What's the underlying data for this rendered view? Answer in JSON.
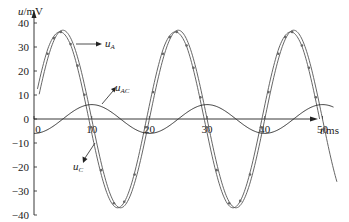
{
  "chart_data": {
    "type": "line",
    "title": "",
    "xlabel": "t/ms",
    "ylabel": "u/mV",
    "xlim": [
      0,
      55
    ],
    "ylim": [
      -40,
      42
    ],
    "grid": false,
    "x_ticks": [
      0,
      10,
      20,
      30,
      40,
      50
    ],
    "y_ticks": [
      40,
      30,
      20,
      10,
      0,
      -10,
      -20,
      -30,
      -40
    ],
    "series": [
      {
        "name": "u_A",
        "description": "sinusoid, amplitude ~37 mV, period ~20 ms, peaks near t=5, 25, 45 ms",
        "amplitude": 37,
        "period_ms": 20,
        "peak_times_ms": [
          4.5,
          25,
          45
        ],
        "trough_times_ms": [
          15,
          35
        ]
      },
      {
        "name": "u_C",
        "description": "sinusoid nearly coincident with u_A, slightly phase-lagged, amplitude ~37 mV",
        "amplitude": 37,
        "period_ms": 20,
        "peak_times_ms": [
          5,
          25.5,
          45.5
        ],
        "trough_times_ms": [
          15.5,
          35.5
        ]
      },
      {
        "name": "u_AC",
        "description": "small sinusoid, amplitude ~6 mV, period ~20 ms, starts ~-6 at t=0, peaks near t=10, 30, 50",
        "amplitude": 6,
        "period_ms": 20,
        "peak_times_ms": [
          10,
          30,
          50
        ],
        "trough_times_ms": [
          0,
          20,
          40
        ]
      }
    ],
    "annotations": [
      {
        "text": "u_A",
        "points_to": "u_A curve near t=10ms, 32mV"
      },
      {
        "text": "u_AC",
        "points_to": "u_AC curve near t=13ms"
      },
      {
        "text": "u_C",
        "points_to": "u_C curve near t=9ms, -10mV"
      }
    ]
  },
  "labels": {
    "ylabel_main": "u",
    "ylabel_unit": "/mV",
    "xlabel_main": "t",
    "xlabel_unit": "/ms",
    "uA_main": "u",
    "uA_sub": "A",
    "uAC_main": "u",
    "uAC_sub": "AC",
    "uC_main": "u",
    "uC_sub": "C"
  }
}
